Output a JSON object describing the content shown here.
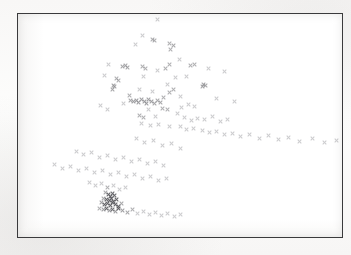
{
  "figure": {
    "type": "scanned-figure",
    "title": "",
    "caption": "",
    "marker": "x-marker",
    "marker_color": "#8d8d91",
    "border_color": "#3a3a3c",
    "background_color": "#ffffff",
    "page_color": "#fbfbfa"
  },
  "chart_data": {
    "type": "scatter",
    "title": "",
    "subtitle": "",
    "xlabel": "",
    "ylabel": "",
    "xlim": [
      0,
      326
    ],
    "ylim": [
      0,
      225
    ],
    "grid": false,
    "legend": null,
    "axis_ticks": {
      "x": [],
      "y": []
    },
    "annotations": [],
    "series": [
      {
        "name": "observations",
        "marker": "x",
        "color": "#8d8d91",
        "n_points": 168,
        "points": [
          [
            140,
            6
          ],
          [
            125,
            22
          ],
          [
            118,
            31
          ],
          [
            135,
            26
          ],
          [
            137,
            27
          ],
          [
            152,
            30
          ],
          [
            156,
            32
          ],
          [
            153,
            36
          ],
          [
            162,
            46
          ],
          [
            91,
            51
          ],
          [
            152,
            51
          ],
          [
            174,
            52
          ],
          [
            178,
            51
          ],
          [
            105,
            53
          ],
          [
            108,
            52
          ],
          [
            110,
            54
          ],
          [
            125,
            53
          ],
          [
            128,
            55
          ],
          [
            148,
            55
          ],
          [
            140,
            57
          ],
          [
            192,
            55
          ],
          [
            99,
            65
          ],
          [
            101,
            67
          ],
          [
            208,
            58
          ],
          [
            87,
            62
          ],
          [
            126,
            63
          ],
          [
            158,
            64
          ],
          [
            170,
            63
          ],
          [
            96,
            72
          ],
          [
            97,
            73
          ],
          [
            122,
            76
          ],
          [
            150,
            71
          ],
          [
            186,
            73
          ],
          [
            95,
            76
          ],
          [
            135,
            78
          ],
          [
            152,
            79
          ],
          [
            156,
            76
          ],
          [
            187,
            71
          ],
          [
            189,
            72
          ],
          [
            112,
            82
          ],
          [
            146,
            84
          ],
          [
            163,
            83
          ],
          [
            106,
            90
          ],
          [
            113,
            87
          ],
          [
            116,
            88
          ],
          [
            119,
            87
          ],
          [
            121,
            89
          ],
          [
            124,
            86
          ],
          [
            127,
            88
          ],
          [
            129,
            90
          ],
          [
            131,
            86
          ],
          [
            134,
            88
          ],
          [
            137,
            90
          ],
          [
            140,
            87
          ],
          [
            143,
            89
          ],
          [
            165,
            94
          ],
          [
            172,
            91
          ],
          [
            178,
            93
          ],
          [
            200,
            85
          ],
          [
            218,
            88
          ],
          [
            83,
            92
          ],
          [
            90,
            96
          ],
          [
            131,
            96
          ],
          [
            145,
            95
          ],
          [
            150,
            96
          ],
          [
            122,
            102
          ],
          [
            126,
            104
          ],
          [
            138,
            103
          ],
          [
            160,
            100
          ],
          [
            168,
            104
          ],
          [
            175,
            107
          ],
          [
            181,
            105
          ],
          [
            188,
            106
          ],
          [
            196,
            103
          ],
          [
            204,
            108
          ],
          [
            211,
            106
          ],
          [
            124,
            110
          ],
          [
            133,
            112
          ],
          [
            141,
            111
          ],
          [
            152,
            113
          ],
          [
            163,
            114
          ],
          [
            170,
            117
          ],
          [
            177,
            116
          ],
          [
            186,
            118
          ],
          [
            193,
            120
          ],
          [
            200,
            119
          ],
          [
            208,
            122
          ],
          [
            216,
            121
          ],
          [
            224,
            124
          ],
          [
            233,
            122
          ],
          [
            243,
            126
          ],
          [
            252,
            123
          ],
          [
            262,
            127
          ],
          [
            272,
            125
          ],
          [
            283,
            129
          ],
          [
            296,
            126
          ],
          [
            308,
            130
          ],
          [
            320,
            128
          ],
          [
            119,
            126
          ],
          [
            127,
            130
          ],
          [
            136,
            128
          ],
          [
            145,
            133
          ],
          [
            154,
            131
          ],
          [
            163,
            136
          ],
          [
            59,
            139
          ],
          [
            66,
            142
          ],
          [
            74,
            140
          ],
          [
            82,
            145
          ],
          [
            90,
            143
          ],
          [
            98,
            147
          ],
          [
            106,
            145
          ],
          [
            114,
            149
          ],
          [
            122,
            147
          ],
          [
            130,
            151
          ],
          [
            138,
            149
          ],
          [
            146,
            153
          ],
          [
            37,
            152
          ],
          [
            45,
            156
          ],
          [
            53,
            154
          ],
          [
            61,
            158
          ],
          [
            69,
            156
          ],
          [
            77,
            160
          ],
          [
            85,
            158
          ],
          [
            93,
            162
          ],
          [
            101,
            160
          ],
          [
            109,
            164
          ],
          [
            117,
            162
          ],
          [
            125,
            166
          ],
          [
            133,
            164
          ],
          [
            141,
            168
          ],
          [
            149,
            166
          ],
          [
            72,
            170
          ],
          [
            78,
            173
          ],
          [
            84,
            171
          ],
          [
            90,
            175
          ],
          [
            96,
            173
          ],
          [
            102,
            177
          ],
          [
            108,
            175
          ],
          [
            88,
            180
          ],
          [
            91,
            182
          ],
          [
            93,
            184
          ],
          [
            95,
            181
          ],
          [
            97,
            183
          ],
          [
            86,
            186
          ],
          [
            89,
            187
          ],
          [
            92,
            188
          ],
          [
            94,
            186
          ],
          [
            96,
            189
          ],
          [
            99,
            187
          ],
          [
            84,
            190
          ],
          [
            87,
            192
          ],
          [
            90,
            191
          ],
          [
            93,
            193
          ],
          [
            95,
            190
          ],
          [
            98,
            192
          ],
          [
            101,
            194
          ],
          [
            104,
            191
          ],
          [
            82,
            196
          ],
          [
            86,
            197
          ],
          [
            89,
            196
          ],
          [
            92,
            198
          ],
          [
            95,
            197
          ],
          [
            98,
            199
          ],
          [
            101,
            196
          ],
          [
            105,
            198
          ],
          [
            110,
            200
          ],
          [
            115,
            197
          ],
          [
            120,
            201
          ],
          [
            126,
            199
          ],
          [
            132,
            202
          ],
          [
            138,
            200
          ],
          [
            144,
            203
          ],
          [
            150,
            201
          ],
          [
            157,
            204
          ],
          [
            164,
            202
          ]
        ]
      }
    ]
  }
}
